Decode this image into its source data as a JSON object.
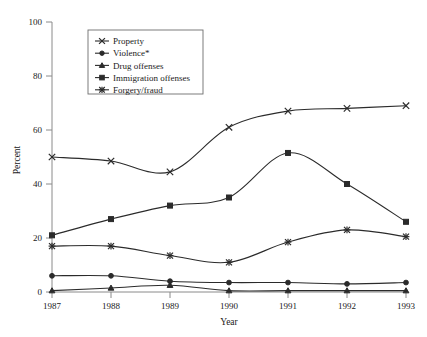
{
  "chart_data": {
    "type": "line",
    "title": "",
    "xlabel": "Year",
    "ylabel": "Percent",
    "categories": [
      "1987",
      "1988",
      "1989",
      "1990",
      "1991",
      "1992",
      "1993"
    ],
    "x": [
      1987,
      1988,
      1989,
      1990,
      1991,
      1992,
      1993
    ],
    "xlim": [
      1987,
      1993
    ],
    "ylim": [
      0,
      100
    ],
    "yticks": [
      0,
      20,
      40,
      60,
      80,
      100
    ],
    "ytick_labels": [
      "0",
      "20",
      "40",
      "60",
      "80",
      "100"
    ],
    "xtick_labels": [
      "1987",
      "1988",
      "1989",
      "1990",
      "1991",
      "1992",
      "1993"
    ],
    "grid": false,
    "legend_position": "top-center",
    "series": [
      {
        "name": "Property",
        "marker": "x-cross",
        "values": [
          50,
          48.5,
          44.5,
          61,
          67,
          68,
          69
        ]
      },
      {
        "name": "Violence*",
        "marker": "filled-circle",
        "values": [
          6,
          6,
          4,
          3.5,
          3.5,
          3,
          3.5
        ]
      },
      {
        "name": "Drug offenses",
        "marker": "filled-triangle",
        "values": [
          0.5,
          1.5,
          2.5,
          0.5,
          0.5,
          0.5,
          0.5
        ]
      },
      {
        "name": "Immigration offenses",
        "marker": "filled-square",
        "values": [
          21,
          27,
          32,
          35,
          51.5,
          40,
          26
        ]
      },
      {
        "name": "Forgery/fraud",
        "marker": "asterisk-cross",
        "values": [
          17,
          17,
          13.5,
          11,
          18.5,
          23,
          20.5
        ]
      }
    ]
  },
  "legend": {
    "entries": [
      {
        "label": "Property"
      },
      {
        "label": "Violence*"
      },
      {
        "label": "Drug offenses"
      },
      {
        "label": "Immigration offenses"
      },
      {
        "label": "Forgery/fraud"
      }
    ]
  },
  "axes": {
    "y_title": "Percent",
    "x_title": "Year",
    "y_labels": [
      "100",
      "80",
      "60",
      "40",
      "20",
      "0"
    ],
    "x_labels": [
      "1987",
      "1988",
      "1989",
      "1990",
      "1991",
      "1992",
      "1993"
    ]
  },
  "colors": {
    "line": "#2b2b2b",
    "axis": "#8a8a8a",
    "text": "#1a1a1a",
    "background": "#ffffff",
    "legend_border": "#6e6e6e"
  }
}
